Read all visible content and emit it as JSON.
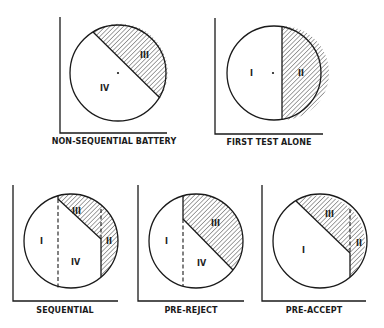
{
  "figure": {
    "panels": [
      {
        "id": "non-sequential-battery",
        "caption": "NON-SEQUENTIAL BATTERY",
        "regions": [
          {
            "label": "III",
            "shaded": true
          },
          {
            "label": "IV",
            "shaded": false
          }
        ],
        "center_dot": true
      },
      {
        "id": "first-test-alone",
        "caption": "FIRST TEST ALONE",
        "regions": [
          {
            "label": "I",
            "shaded": false
          },
          {
            "label": "II",
            "shaded": true
          }
        ],
        "center_dot": true
      },
      {
        "id": "sequential",
        "caption": "SEQUENTIAL",
        "regions": [
          {
            "label": "I",
            "shaded": false
          },
          {
            "label": "III",
            "shaded": true
          },
          {
            "label": "II",
            "shaded": true
          },
          {
            "label": "IV",
            "shaded": false
          }
        ]
      },
      {
        "id": "pre-reject",
        "caption": "PRE-REJECT",
        "regions": [
          {
            "label": "I",
            "shaded": false
          },
          {
            "label": "III",
            "shaded": true
          },
          {
            "label": "IV",
            "shaded": false
          }
        ]
      },
      {
        "id": "pre-accept",
        "caption": "PRE-ACCEPT",
        "regions": [
          {
            "label": "III",
            "shaded": true
          },
          {
            "label": "I",
            "shaded": false
          },
          {
            "label": "II",
            "shaded": true
          }
        ]
      }
    ],
    "colors": {
      "ink": "#1a1a1a",
      "background": "#ffffff"
    }
  }
}
